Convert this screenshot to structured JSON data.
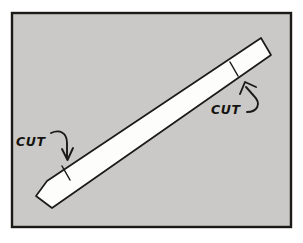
{
  "figure": {
    "kind": "hand-drawn-diagram",
    "panel": {
      "frame_color": "#1b1a18",
      "background_color": "#c9c8c6",
      "outer_margin_color": "#ffffff",
      "frame_rect": {
        "x": 12,
        "y": 13,
        "width": 279,
        "height": 214
      },
      "frame_stroke_width": 2.4
    },
    "strip": {
      "name": "paper-strip",
      "fill_color": "#fdfdfb",
      "stroke_color": "#1b1a18",
      "stroke_width": 1.6,
      "angle_degrees": -31,
      "corners": [
        {
          "x": 36,
          "y": 196
        },
        {
          "x": 47,
          "y": 181
        },
        {
          "x": 261,
          "y": 38
        },
        {
          "x": 271,
          "y": 55
        },
        {
          "x": 52,
          "y": 208
        }
      ]
    },
    "cut_marks": [
      {
        "name": "cut-mark-left",
        "x1": 62,
        "y1": 166,
        "x2": 70,
        "y2": 180
      },
      {
        "name": "cut-mark-right",
        "x1": 230,
        "y1": 62,
        "x2": 238,
        "y2": 76
      }
    ],
    "annotations": [
      {
        "id": "cut-left",
        "label": "CUT",
        "label_x": 16,
        "label_y": 146,
        "arrow": {
          "name": "curved-arrow-down",
          "direction": "down",
          "path": "M 51 133 C 60 129, 67 133, 67 143 L 67 157",
          "head": "M 62 150 L 67 159 L 72 149"
        }
      },
      {
        "id": "cut-right",
        "label": "CUT",
        "label_x": 211,
        "label_y": 114,
        "arrow": {
          "name": "curved-arrow-up",
          "direction": "up",
          "path": "M 249 110 C 258 110, 261 103, 254 96 L 246 86",
          "head": "M 241 93 L 245 83 L 255 86"
        }
      }
    ]
  },
  "colors": {
    "ink": "#1b1a18",
    "panel_grey": "#c9c8c6",
    "strip_white": "#fdfdfb",
    "page_white": "#ffffff"
  }
}
